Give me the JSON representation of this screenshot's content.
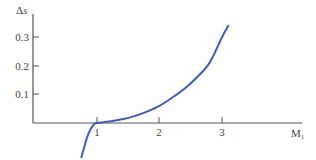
{
  "chart_data": {
    "type": "line",
    "title": "",
    "xlabel": "M",
    "xlabel_sub": "1",
    "ylabel_delta": "Δ",
    "ylabel_var": "s",
    "x_ticks": [
      "1",
      "2",
      "3"
    ],
    "y_ticks": [
      "0.1",
      "0.2",
      "0.3"
    ],
    "xlim": [
      0,
      3.4
    ],
    "ylim": [
      -0.12,
      0.42
    ],
    "grid": false,
    "series": [
      {
        "name": "Δs",
        "color": "#3a5fb8",
        "x": [
          0.75,
          0.8,
          0.85,
          0.9,
          0.95,
          1.0,
          1.2,
          1.4,
          1.6,
          1.8,
          2.0,
          2.2,
          2.4,
          2.6,
          2.8,
          3.0,
          3.1
        ],
        "y": [
          -0.12,
          -0.08,
          -0.045,
          -0.02,
          -0.005,
          0.0,
          0.005,
          0.013,
          0.024,
          0.04,
          0.06,
          0.088,
          0.12,
          0.16,
          0.21,
          0.3,
          0.34
        ]
      }
    ]
  }
}
